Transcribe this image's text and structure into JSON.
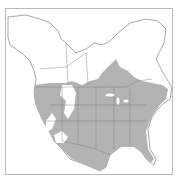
{
  "map": {
    "title": "Species range map — North America",
    "region": "North America",
    "legend": {
      "range_label": "Range",
      "range_color": "#b3b3b3",
      "land_color": "#ffffff",
      "border_color": "#6e6e6e",
      "frame_color": "#b9b9b9"
    },
    "range_description": "Shaded range covering most of the contiguous United States, southern Canada and northern Mexico, excluding parts of the Great Basin/Rocky Mountain interior"
  }
}
